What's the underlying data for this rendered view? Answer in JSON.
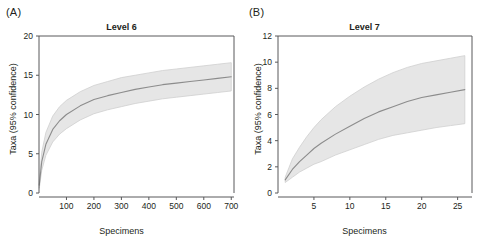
{
  "figure": {
    "background": "#ffffff",
    "band_color": "#e6e6e6",
    "band_edge_color": "#cfcfcf",
    "mean_line_color": "#8c8c8c",
    "axis_color": "#58595b"
  },
  "panels": [
    {
      "letter": "(A)",
      "title": "Level 6",
      "xlabel": "Specimens",
      "ylabel": "Taxa (95% confidence)"
    },
    {
      "letter": "(B)",
      "title": "Level 7",
      "xlabel": "Specimens",
      "ylabel": "Taxa (95% confidence)"
    }
  ],
  "chart_data": [
    {
      "type": "line",
      "title": "Level 6",
      "panel": "(A)",
      "xlabel": "Specimens",
      "ylabel": "Taxa (95% confidence)",
      "xlim": [
        0,
        710
      ],
      "ylim": [
        0,
        20
      ],
      "xticks": [
        100,
        200,
        300,
        400,
        500,
        600,
        700
      ],
      "xticklabels": [
        "100",
        "200",
        "300",
        "400",
        "500",
        "600",
        "700"
      ],
      "yticks": [
        0,
        5,
        10,
        15,
        20
      ],
      "yticklabels": [
        "0",
        "5",
        "10",
        "15",
        "20"
      ],
      "grid": false,
      "legend": "none",
      "x": [
        1,
        10,
        25,
        50,
        75,
        100,
        150,
        200,
        250,
        300,
        350,
        400,
        450,
        500,
        550,
        600,
        650,
        700
      ],
      "series": [
        {
          "name": "Mean rarefaction",
          "values": [
            1.0,
            4.0,
            6.2,
            8.1,
            9.2,
            10.0,
            11.1,
            11.9,
            12.4,
            12.8,
            13.2,
            13.5,
            13.8,
            14.0,
            14.2,
            14.4,
            14.6,
            14.8
          ]
        },
        {
          "name": "Upper 95% confidence",
          "values": [
            1.5,
            5.2,
            7.7,
            9.8,
            11.0,
            11.8,
            12.9,
            13.7,
            14.2,
            14.7,
            15.0,
            15.3,
            15.6,
            15.8,
            16.0,
            16.2,
            16.4,
            16.6
          ]
        },
        {
          "name": "Lower 95% confidence",
          "values": [
            0.6,
            2.9,
            4.8,
            6.5,
            7.5,
            8.2,
            9.3,
            10.1,
            10.6,
            11.0,
            11.4,
            11.7,
            12.0,
            12.2,
            12.4,
            12.6,
            12.8,
            13.0
          ]
        }
      ]
    },
    {
      "type": "line",
      "title": "Level 7",
      "panel": "(B)",
      "xlabel": "Specimens",
      "ylabel": "Taxa (95% confidence)",
      "xlim": [
        0,
        27
      ],
      "ylim": [
        0,
        12
      ],
      "xticks": [
        5,
        10,
        15,
        20,
        25
      ],
      "xticklabels": [
        "5",
        "10",
        "15",
        "20",
        "25"
      ],
      "yticks": [
        0,
        2,
        4,
        6,
        8,
        10,
        12
      ],
      "yticklabels": [
        "0",
        "2",
        "4",
        "6",
        "8",
        "10",
        "12"
      ],
      "grid": false,
      "legend": "none",
      "x": [
        1,
        2,
        3,
        4,
        5,
        6,
        8,
        10,
        12,
        14,
        16,
        18,
        20,
        22,
        24,
        26
      ],
      "series": [
        {
          "name": "Mean rarefaction",
          "values": [
            1.0,
            1.8,
            2.4,
            2.9,
            3.4,
            3.8,
            4.5,
            5.1,
            5.7,
            6.2,
            6.6,
            7.0,
            7.3,
            7.5,
            7.7,
            7.9
          ]
        },
        {
          "name": "Upper 95% confidence",
          "values": [
            1.2,
            2.6,
            3.5,
            4.3,
            5.0,
            5.6,
            6.6,
            7.4,
            8.1,
            8.7,
            9.2,
            9.6,
            9.9,
            10.1,
            10.3,
            10.5
          ]
        },
        {
          "name": "Lower 95% confidence",
          "values": [
            0.8,
            1.2,
            1.6,
            1.9,
            2.2,
            2.4,
            2.9,
            3.3,
            3.7,
            4.1,
            4.4,
            4.6,
            4.8,
            5.0,
            5.15,
            5.3
          ]
        }
      ]
    }
  ]
}
